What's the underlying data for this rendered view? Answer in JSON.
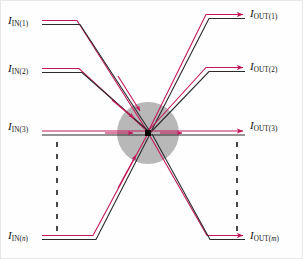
{
  "figure": {
    "background_color": "#fefefe",
    "wire_colors": {
      "signal": "#c2185b",
      "outline": "#2b2b2b"
    },
    "node_color": "#000000",
    "circle_color": "#b8b8b8",
    "dashed_color": "#1a1a1a"
  },
  "inputs": [
    {
      "symbol": "I",
      "sub_main": "IN",
      "index": "1",
      "name": "input-1",
      "y": 22
    },
    {
      "symbol": "I",
      "sub_main": "IN",
      "index": "2",
      "name": "input-2",
      "y": 70
    },
    {
      "symbol": "I",
      "sub_main": "IN",
      "index": "3",
      "name": "input-3",
      "y": 128
    },
    {
      "symbol": "I",
      "sub_main": "IN",
      "index": "n",
      "name": "input-n",
      "y": 237
    }
  ],
  "outputs": [
    {
      "symbol": "I",
      "sub_main": "OUT",
      "index": "1",
      "name": "output-1",
      "y": 16
    },
    {
      "symbol": "I",
      "sub_main": "OUT",
      "index": "2",
      "name": "output-2",
      "y": 69
    },
    {
      "symbol": "I",
      "sub_main": "OUT",
      "index": "3",
      "name": "output-3",
      "y": 127
    },
    {
      "symbol": "I",
      "sub_main": "OUT",
      "index": "m",
      "name": "output-m",
      "y": 237
    }
  ],
  "ellipsis": {
    "left_label": "vertical-dots-inputs",
    "right_label": "vertical-dots-outputs"
  },
  "center_node": {
    "label": "summing-node",
    "cx": 148,
    "cy": 133,
    "radius": 31
  }
}
